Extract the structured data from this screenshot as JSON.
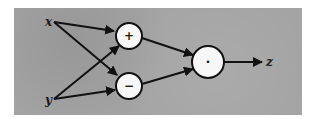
{
  "diagram": {
    "type": "computational-graph",
    "background_color": "#a4a4a4",
    "inputs": [
      {
        "id": "x",
        "label": "x"
      },
      {
        "id": "y",
        "label": "y"
      }
    ],
    "nodes": [
      {
        "id": "add",
        "symbol": "+",
        "operation": "addition"
      },
      {
        "id": "sub",
        "symbol": "−",
        "operation": "subtraction"
      },
      {
        "id": "mul",
        "symbol": "·",
        "operation": "multiplication"
      }
    ],
    "output": {
      "id": "z",
      "label": "z"
    },
    "edges": [
      {
        "from": "x",
        "to": "add"
      },
      {
        "from": "x",
        "to": "sub"
      },
      {
        "from": "y",
        "to": "add"
      },
      {
        "from": "y",
        "to": "sub"
      },
      {
        "from": "add",
        "to": "mul"
      },
      {
        "from": "sub",
        "to": "mul"
      },
      {
        "from": "mul",
        "to": "z"
      }
    ]
  }
}
